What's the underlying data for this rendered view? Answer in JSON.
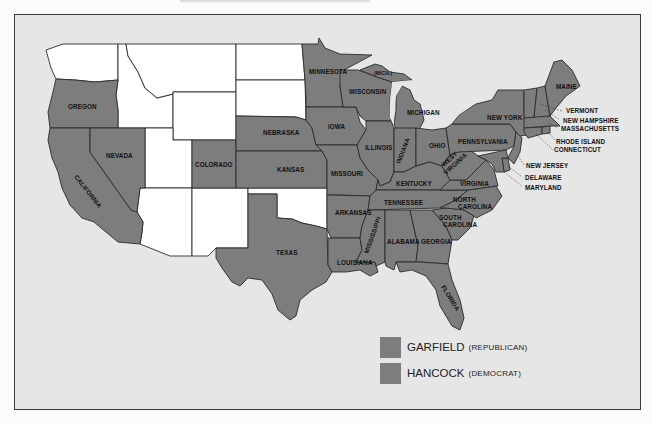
{
  "map": {
    "colors": {
      "garfield": "#7d7d7d",
      "hancock": "#7d7d7d",
      "unassigned": "#ffffff",
      "water": "#e6e6e6"
    },
    "state_labels": {
      "oregon": "OREGON",
      "california": "CALIFORNIA",
      "nevada": "NEVADA",
      "colorado": "COLORADO",
      "nebraska": "NEBRASKA",
      "kansas": "KANSAS",
      "texas": "TEXAS",
      "minnesota": "MINNESOTA",
      "iowa": "IOWA",
      "missouri": "MISSOURI",
      "arkansas": "ARKANSAS",
      "louisiana": "LOUISIANA",
      "wisconsin": "WISCONSIN",
      "mich_up": "(MICH.)",
      "michigan": "MICHIGAN",
      "illinois": "ILLINOIS",
      "indiana": "INDIANA",
      "ohio": "OHIO",
      "kentucky": "KENTUCKY",
      "tennessee": "TENNESSEE",
      "mississippi": "MISSISSIPPI",
      "alabama": "ALABAMA",
      "georgia": "GEORGIA",
      "florida": "FLORIDA",
      "south_carolina_1": "SOUTH",
      "south_carolina_2": "CAROLINA",
      "north_carolina_1": "NORTH",
      "north_carolina_2": "CAROLINA",
      "virginia": "VIRGINIA",
      "west_virginia_1": "WEST",
      "west_virginia_2": "VIRGINIA",
      "pennsylvania": "PENNSYLVANIA",
      "new_york": "NEW YORK",
      "maine": "MAINE",
      "vermont": "VERMONT",
      "new_hampshire": "NEW HAMPSHIRE",
      "massachusetts": "MASSACHUSETTS",
      "rhode_island": "RHODE ISLAND",
      "connecticut": "CONNECTICUT",
      "new_jersey": "NEW JERSEY",
      "delaware": "DELAWARE",
      "maryland": "MARYLAND"
    }
  },
  "legend": {
    "items": [
      {
        "name": "GARFIELD",
        "party": "(REPUBLICAN)",
        "color": "#7d7d7d"
      },
      {
        "name": "HANCOCK",
        "party": "(DEMOCRAT)",
        "color": "#7d7d7d"
      }
    ]
  }
}
